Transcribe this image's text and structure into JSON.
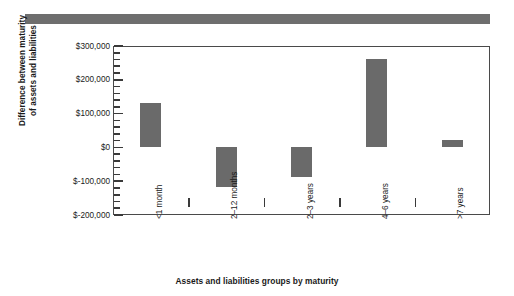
{
  "banner": {
    "name": "top-rule-bar",
    "color": "#6e6e6e"
  },
  "chart_data": {
    "type": "bar",
    "title": "",
    "subtitle": "",
    "xlabel": "Assets and liabilities groups by maturity",
    "ylabel": "Difference between maturity of assets and liabilities",
    "ylabel_line1": "Difference between maturity",
    "ylabel_line2": "of assets and liabilities",
    "categories": [
      "<1 month",
      "2–12 months",
      "2–3 years",
      "4–6 years",
      ">7 years"
    ],
    "values": [
      130000,
      -118000,
      -88000,
      262000,
      22000
    ],
    "bar_ranges": [
      {
        "category": "<1 month",
        "low": 0,
        "high": 130000
      },
      {
        "category": "2–12 months",
        "low": -118000,
        "high": 0
      },
      {
        "category": "2–3 years",
        "low": -88000,
        "high": 0
      },
      {
        "category": "4–6 years",
        "low": 0,
        "high": 262000
      },
      {
        "category": ">7 years",
        "low": 0,
        "high": 22000
      }
    ],
    "ylim": [
      -200000,
      300000
    ],
    "ytick_values": [
      300000,
      200000,
      100000,
      0,
      -100000,
      -200000
    ],
    "ytick_labels": [
      "$300,000",
      "$200,000",
      "$100,000",
      "$0",
      "$-100,000",
      "$-200,000"
    ],
    "y_minor_tick_step": 20000,
    "grid": false,
    "legend": null,
    "series_color": "#6a6a6a",
    "axis_color": "#4a4a4a"
  }
}
